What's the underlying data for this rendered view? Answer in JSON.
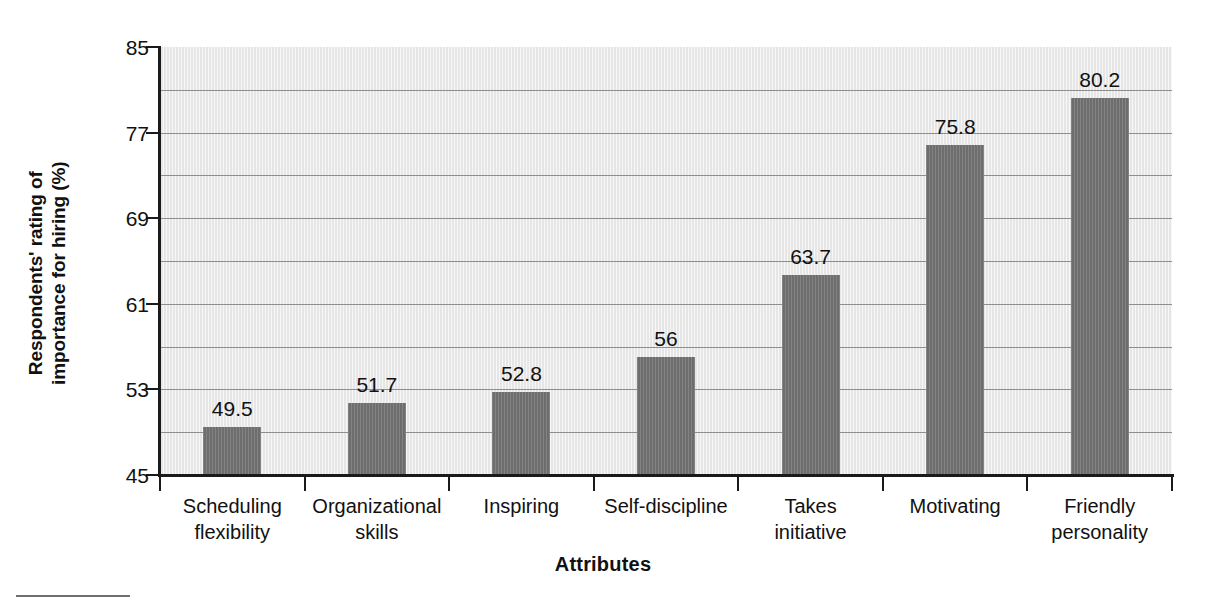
{
  "chart_data": {
    "type": "bar",
    "title": "",
    "subtitle": "",
    "xlabel": "Attributes",
    "ylabel_lines": [
      "Respondents' rating of",
      "importance for hiring (%)"
    ],
    "ylabel": "Respondents' rating of importance for hiring (%)",
    "categories": [
      "Scheduling flexibility",
      "Organizational skills",
      "Inspiring",
      "Self-discipline",
      "Takes initiative",
      "Motivating",
      "Friendly personality"
    ],
    "category_lines": [
      [
        "Scheduling",
        "flexibility"
      ],
      [
        "Organizational",
        "skills"
      ],
      [
        "Inspiring"
      ],
      [
        "Self-discipline"
      ],
      [
        "Takes",
        "initiative"
      ],
      [
        "Motivating"
      ],
      [
        "Friendly",
        "personality"
      ]
    ],
    "values": [
      49.5,
      51.7,
      52.8,
      56,
      63.7,
      75.8,
      80.2
    ],
    "value_labels": [
      "49.5",
      "51.7",
      "52.8",
      "56",
      "63.7",
      "75.8",
      "80.2"
    ],
    "ylim": [
      45,
      85
    ],
    "ytick_values": [
      85,
      77,
      69,
      61,
      53,
      45
    ],
    "ytick_labels": [
      "85",
      "77",
      "69",
      "61",
      "53",
      "45"
    ],
    "ytick_step": 8,
    "gridline_values": [
      81,
      77,
      73,
      69,
      65,
      61,
      57,
      53,
      49,
      45
    ],
    "gridline_step": 4,
    "grid": true,
    "legend": false,
    "legend_position": "none",
    "bar_color": "#757575",
    "plot_background_color": "#ededed",
    "gridline_color": "#8e8e8e",
    "axis_color": "#1a1a1a",
    "text_color": "#111111"
  }
}
